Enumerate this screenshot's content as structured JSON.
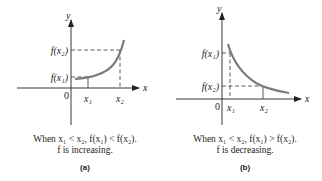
{
  "colors": {
    "curve": "#7a7a7a",
    "axis": "#222222",
    "dash": "#333333",
    "text": "#222222",
    "background": "#ffffff"
  },
  "panels": [
    {
      "id": "a",
      "tag": "(a)",
      "axis_labels": {
        "x": "x",
        "y": "y",
        "origin": "0"
      },
      "y_ticks": [
        "f(x₂)",
        "f(x₁)"
      ],
      "x_ticks": [
        "x₁",
        "x₂"
      ],
      "caption_line1": "When x₁ < x₂,  f(x₁) < f(x₂).",
      "caption_line2": "f is increasing.",
      "behavior": "increasing"
    },
    {
      "id": "b",
      "tag": "(b)",
      "axis_labels": {
        "x": "x",
        "y": "y",
        "origin": "0"
      },
      "y_ticks": [
        "f(x₁)",
        "f(x₂)"
      ],
      "x_ticks": [
        "x₁",
        "x₂"
      ],
      "caption_line1": "When x₁ < x₂, f(x₁) > f(x₂).",
      "caption_line2": "f is decreasing.",
      "behavior": "decreasing"
    }
  ]
}
